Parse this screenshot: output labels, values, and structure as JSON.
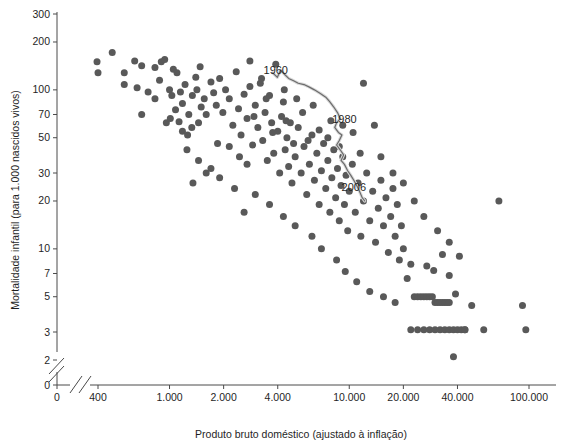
{
  "chart_data": {
    "type": "scatter",
    "title": "",
    "xlabel": "Produto bruto doméstico (ajustado à inflação)",
    "ylabel": "Mortalidade infantil (para 1.000 nascidos vivos)",
    "x_scale": "log",
    "y_scale": "log",
    "xlim": [
      350,
      115000
    ],
    "ylim": [
      1.9,
      320
    ],
    "grid": false,
    "legend": null,
    "x_ticks": [
      {
        "value": 0,
        "label": "0"
      },
      {
        "value": 400,
        "label": "400"
      },
      {
        "value": 1000,
        "label": "1.000"
      },
      {
        "value": 2000,
        "label": "2.000"
      },
      {
        "value": 4000,
        "label": "4.000"
      },
      {
        "value": 10000,
        "label": "10.000"
      },
      {
        "value": 20000,
        "label": "20.000"
      },
      {
        "value": 40000,
        "label": "40.000"
      },
      {
        "value": 100000,
        "label": "100.000"
      }
    ],
    "y_ticks": [
      {
        "value": 300,
        "label": "300"
      },
      {
        "value": 200,
        "label": "200"
      },
      {
        "value": 100,
        "label": "100"
      },
      {
        "value": 70,
        "label": "70"
      },
      {
        "value": 50,
        "label": "50"
      },
      {
        "value": 30,
        "label": "30"
      },
      {
        "value": 20,
        "label": "20"
      },
      {
        "value": 10,
        "label": "10"
      },
      {
        "value": 7,
        "label": "7"
      },
      {
        "value": 5,
        "label": "5"
      },
      {
        "value": 3,
        "label": "3"
      },
      {
        "value": 2,
        "label": "2"
      },
      {
        "value": 0,
        "label": "0"
      }
    ],
    "axis_breaks": {
      "x_break": true,
      "y_break": true,
      "note": "double-slash break marks near origin on both axes"
    },
    "annotations": [
      {
        "label": "1960",
        "x": 3900,
        "y": 125
      },
      {
        "label": "1980",
        "x": 9400,
        "y": 62
      },
      {
        "label": "2006",
        "x": 10600,
        "y": 23
      }
    ],
    "series": [
      {
        "name": "Países",
        "marker": "circle",
        "color": "#595959",
        "points": [
          [
            395,
            150
          ],
          [
            400,
            128
          ],
          [
            480,
            172
          ],
          [
            560,
            128
          ],
          [
            700,
            70
          ],
          [
            560,
            108
          ],
          [
            660,
            103
          ],
          [
            640,
            152
          ],
          [
            760,
            97
          ],
          [
            900,
            150
          ],
          [
            940,
            155
          ],
          [
            880,
            115
          ],
          [
            830,
            88
          ],
          [
            1000,
            100
          ],
          [
            1030,
            92
          ],
          [
            1100,
            128
          ],
          [
            1150,
            97
          ],
          [
            1180,
            82
          ],
          [
            1080,
            75
          ],
          [
            1220,
            108
          ],
          [
            960,
            62
          ],
          [
            1010,
            66
          ],
          [
            1130,
            63
          ],
          [
            1280,
            70
          ],
          [
            1340,
            92
          ],
          [
            1400,
            120
          ],
          [
            1420,
            100
          ],
          [
            1330,
            58
          ],
          [
            1260,
            52
          ],
          [
            1180,
            55
          ],
          [
            1500,
            78
          ],
          [
            1560,
            88
          ],
          [
            1600,
            70
          ],
          [
            1450,
            62
          ],
          [
            1700,
            112
          ],
          [
            1760,
            96
          ],
          [
            1820,
            80
          ],
          [
            1900,
            118
          ],
          [
            1980,
            72
          ],
          [
            2050,
            100
          ],
          [
            2150,
            88
          ],
          [
            2250,
            60
          ],
          [
            2350,
            130
          ],
          [
            2420,
            76
          ],
          [
            2500,
            52
          ],
          [
            2600,
            94
          ],
          [
            2700,
            66
          ],
          [
            2800,
            105
          ],
          [
            2900,
            45
          ],
          [
            3000,
            80
          ],
          [
            3100,
            58
          ],
          [
            3200,
            110
          ],
          [
            3300,
            48
          ],
          [
            3400,
            72
          ],
          [
            3500,
            36
          ],
          [
            3600,
            92
          ],
          [
            3700,
            62
          ],
          [
            3800,
            40
          ],
          [
            3900,
            145
          ],
          [
            4000,
            55
          ],
          [
            4100,
            30
          ],
          [
            4200,
            68
          ],
          [
            4300,
            84
          ],
          [
            4400,
            42
          ],
          [
            4500,
            50
          ],
          [
            4600,
            33
          ],
          [
            4700,
            62
          ],
          [
            4800,
            26
          ],
          [
            4900,
            46
          ],
          [
            5000,
            38
          ],
          [
            5200,
            58
          ],
          [
            5400,
            30
          ],
          [
            5600,
            44
          ],
          [
            5800,
            22
          ],
          [
            6000,
            34
          ],
          [
            6200,
            52
          ],
          [
            6400,
            27
          ],
          [
            6600,
            40
          ],
          [
            6800,
            19
          ],
          [
            7000,
            31
          ],
          [
            7200,
            46
          ],
          [
            7400,
            24
          ],
          [
            7600,
            36
          ],
          [
            7800,
            17
          ],
          [
            8000,
            28
          ],
          [
            8200,
            42
          ],
          [
            8400,
            21
          ],
          [
            8600,
            32
          ],
          [
            8800,
            15
          ],
          [
            9000,
            25
          ],
          [
            9200,
            38
          ],
          [
            9400,
            19
          ],
          [
            9600,
            29
          ],
          [
            9800,
            13
          ],
          [
            10000,
            23
          ],
          [
            10400,
            34
          ],
          [
            10800,
            17
          ],
          [
            11200,
            26
          ],
          [
            11600,
            12
          ],
          [
            12000,
            20
          ],
          [
            12500,
            30
          ],
          [
            13000,
            15
          ],
          [
            13500,
            23
          ],
          [
            14000,
            11
          ],
          [
            14500,
            18
          ],
          [
            15000,
            27
          ],
          [
            15500,
            14
          ],
          [
            16000,
            21
          ],
          [
            16500,
            9.5
          ],
          [
            17000,
            16
          ],
          [
            17500,
            24
          ],
          [
            18000,
            12
          ],
          [
            18500,
            19
          ],
          [
            19000,
            8.5
          ],
          [
            19500,
            14
          ],
          [
            20000,
            10
          ],
          [
            21000,
            6.5
          ],
          [
            22000,
            8
          ],
          [
            23000,
            5
          ],
          [
            24000,
            5
          ],
          [
            25000,
            5
          ],
          [
            26000,
            5
          ],
          [
            27000,
            5
          ],
          [
            28000,
            5
          ],
          [
            29000,
            5
          ],
          [
            30000,
            4.6
          ],
          [
            31000,
            4.6
          ],
          [
            32000,
            4.6
          ],
          [
            33000,
            4.6
          ],
          [
            34000,
            4.6
          ],
          [
            35000,
            4.6
          ],
          [
            36000,
            4.6
          ],
          [
            22000,
            3.1
          ],
          [
            24000,
            3.1
          ],
          [
            26000,
            3.1
          ],
          [
            28000,
            3.1
          ],
          [
            30000,
            3.1
          ],
          [
            32000,
            3.1
          ],
          [
            34000,
            3.1
          ],
          [
            36000,
            3.1
          ],
          [
            38000,
            3.1
          ],
          [
            40000,
            3.1
          ],
          [
            42000,
            3.1
          ],
          [
            44000,
            3.1
          ],
          [
            27000,
            7.8
          ],
          [
            29500,
            7.3
          ],
          [
            33000,
            9.2
          ],
          [
            36000,
            6.8
          ],
          [
            39000,
            5.2
          ],
          [
            44000,
            3.1
          ],
          [
            38000,
            2.1
          ],
          [
            48000,
            4.4
          ],
          [
            56000,
            3.1
          ],
          [
            68000,
            20
          ],
          [
            92000,
            4.4
          ],
          [
            96000,
            3.1
          ],
          [
            1050,
            135
          ],
          [
            1480,
            140
          ],
          [
            700,
            142
          ],
          [
            830,
            138
          ],
          [
            2800,
            152
          ],
          [
            3250,
            118
          ],
          [
            12000,
            110
          ],
          [
            13800,
            60
          ],
          [
            5500,
            72
          ],
          [
            6300,
            80
          ],
          [
            4350,
            100
          ],
          [
            5100,
            88
          ],
          [
            3450,
            88
          ],
          [
            2950,
            68
          ],
          [
            3750,
            54
          ],
          [
            4450,
            64
          ],
          [
            2150,
            44
          ],
          [
            2450,
            38
          ],
          [
            1850,
            46
          ],
          [
            2700,
            34
          ],
          [
            5900,
            48
          ],
          [
            6800,
            56
          ],
          [
            7600,
            50
          ],
          [
            8800,
            44
          ],
          [
            10500,
            54
          ],
          [
            11500,
            40
          ],
          [
            9200,
            60
          ],
          [
            7900,
            64
          ],
          [
            15000,
            38
          ],
          [
            17500,
            30
          ],
          [
            20000,
            26
          ],
          [
            23000,
            20
          ],
          [
            26000,
            16
          ],
          [
            31000,
            13
          ],
          [
            36000,
            11
          ],
          [
            41000,
            9
          ],
          [
            1900,
            28
          ],
          [
            2300,
            24
          ],
          [
            1700,
            32
          ],
          [
            3000,
            22
          ],
          [
            3600,
            19
          ],
          [
            4300,
            16
          ],
          [
            5000,
            14
          ],
          [
            2600,
            17
          ],
          [
            7000,
            10
          ],
          [
            8500,
            8.5
          ],
          [
            6200,
            12
          ],
          [
            9500,
            7.2
          ],
          [
            11000,
            6.2
          ],
          [
            13000,
            5.4
          ],
          [
            15500,
            5
          ],
          [
            18000,
            4.6
          ],
          [
            1250,
            42
          ],
          [
            1450,
            36
          ],
          [
            1600,
            30
          ],
          [
            1350,
            26
          ]
        ]
      }
    ],
    "trendline": {
      "name": "Evolução temporal 1960-2006",
      "color": "#6b6b6b",
      "points": [
        [
          3750,
          128
        ],
        [
          3980,
          120
        ],
        [
          4150,
          133
        ],
        [
          4400,
          124
        ],
        [
          4600,
          118
        ],
        [
          4900,
          114
        ],
        [
          5200,
          110
        ],
        [
          5600,
          108
        ],
        [
          6000,
          104
        ],
        [
          6400,
          100
        ],
        [
          6900,
          95
        ],
        [
          7400,
          90
        ],
        [
          7800,
          84
        ],
        [
          8200,
          78
        ],
        [
          8600,
          72
        ],
        [
          8900,
          66
        ],
        [
          8500,
          62
        ],
        [
          8300,
          58
        ],
        [
          8700,
          54
        ],
        [
          9100,
          52
        ],
        [
          8800,
          48
        ],
        [
          8500,
          45
        ],
        [
          8900,
          42
        ],
        [
          9300,
          39
        ],
        [
          9000,
          36
        ],
        [
          9400,
          34
        ],
        [
          9800,
          31
        ],
        [
          10200,
          29
        ],
        [
          10600,
          27
        ],
        [
          11000,
          25
        ],
        [
          11400,
          23
        ],
        [
          11800,
          21
        ],
        [
          12200,
          20
        ]
      ]
    }
  }
}
